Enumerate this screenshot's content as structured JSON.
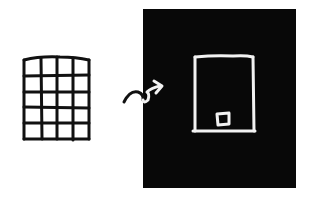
{
  "diagram": {
    "background": "#ffffff",
    "ink_color": "#111111",
    "panel_color": "#080808",
    "panel_ink_color": "#f2f2f2",
    "grid": {
      "label": "grid of cells",
      "columns": 4,
      "rows": 5,
      "x": 23,
      "y": 57,
      "width": 67,
      "height": 83
    },
    "arrow": {
      "label": "curly transition arrow",
      "direction": "right"
    },
    "panel": {
      "label": "black panel",
      "x": 143,
      "y": 9,
      "width": 153,
      "height": 179
    },
    "frame": {
      "label": "single frame outline",
      "x": 193,
      "y": 56,
      "width": 61,
      "height": 76
    },
    "marker": {
      "label": "small square marker",
      "x": 216,
      "y": 112,
      "width": 14,
      "height": 13
    }
  }
}
